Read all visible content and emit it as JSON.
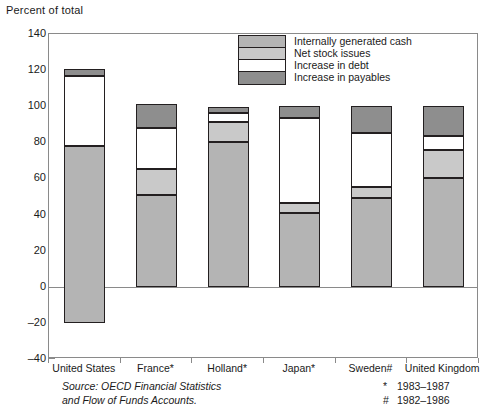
{
  "chart_data": {
    "type": "bar",
    "title": "",
    "ylabel": "Percent of total",
    "xlabel": "",
    "ylim": [
      -40,
      140
    ],
    "ytick_step": 20,
    "yticks": [
      140,
      120,
      100,
      80,
      60,
      40,
      20,
      0,
      -20,
      -40
    ],
    "grid": false,
    "stacked": true,
    "legend_position": "top-center-inside",
    "categories": [
      "United States",
      "France*",
      "Holland*",
      "Japan*",
      "Sweden#",
      "United Kingdom"
    ],
    "series": [
      {
        "name": "Internally generated cash",
        "color": "#b4b4b4",
        "values": [
          98,
          51,
          80,
          41,
          49,
          60
        ]
      },
      {
        "name": "Net stock issues",
        "color": "#c9c9c9",
        "values": [
          0,
          14,
          11,
          5.5,
          6,
          16
        ]
      },
      {
        "name": "Increase in debt",
        "color": "#ffffff",
        "values": [
          39,
          23,
          5,
          47,
          30,
          7.5
        ]
      },
      {
        "name": "Increase in payables",
        "color": "#8e8e8e",
        "values": [
          3.5,
          13.5,
          3.5,
          6.5,
          15,
          16.5
        ]
      }
    ],
    "bar_spans": [
      {
        "category": "United States",
        "bottom": -20,
        "breaks": [
          -20,
          78,
          78,
          117,
          120.5
        ]
      },
      {
        "category": "France*",
        "bottom": 0,
        "breaks": [
          0,
          51,
          65,
          88,
          101.5
        ]
      },
      {
        "category": "Holland*",
        "bottom": 0,
        "breaks": [
          0,
          80,
          91,
          96,
          99.5
        ]
      },
      {
        "category": "Japan*",
        "bottom": 0,
        "breaks": [
          0,
          41,
          46.5,
          93.5,
          100
        ]
      },
      {
        "category": "Sweden#",
        "bottom": 0,
        "breaks": [
          0,
          49,
          55,
          85,
          100
        ]
      },
      {
        "category": "United Kingdom",
        "bottom": 0,
        "breaks": [
          0,
          60,
          76,
          83.5,
          100
        ]
      }
    ],
    "annotations": {
      "source_line1": "Source: OECD Financial Statistics",
      "source_line2": "and Flow of Funds Accounts.",
      "note1_symbol": "*",
      "note1_text": "1983–1987",
      "note2_symbol": "#",
      "note2_text": "1982–1986"
    }
  },
  "legend": {
    "items": [
      {
        "label": "Internally generated cash",
        "color": "#b4b4b4"
      },
      {
        "label": "Net stock issues",
        "color": "#c9c9c9"
      },
      {
        "label": "Increase in debt",
        "color": "#ffffff"
      },
      {
        "label": "Increase in payables",
        "color": "#8e8e8e"
      }
    ]
  }
}
